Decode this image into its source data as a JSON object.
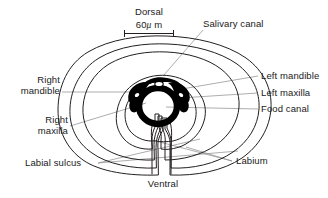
{
  "figure": {
    "background_color": "#ffffff",
    "outline_color": "#231f20",
    "leader_color": "#8a8a8a",
    "text_color": "#1a1a1a"
  },
  "orientation": {
    "dorsal": "Dorsal",
    "ventral": "Ventral"
  },
  "scale_bar": {
    "value": "60",
    "unit_mu": "μ",
    "unit_m": " m",
    "full_text": "60μ m"
  },
  "labels": {
    "salivary_canal": "Salivary canal",
    "left_mandible": "Left mandible",
    "left_maxilla": "Left maxilla",
    "food_canal": "Food canal",
    "labium": "Labium",
    "labial_sulcus": "Labial sulcus",
    "right_mandible_line1": "Right",
    "right_mandible_line2": "mandible",
    "right_maxilla_line1": "Right",
    "right_maxilla_line2": "maxilla"
  }
}
